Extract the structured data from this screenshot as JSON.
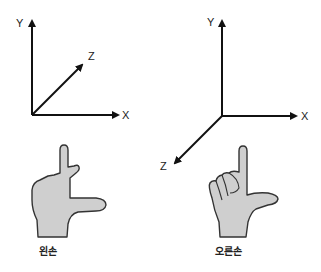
{
  "left_diagram": {
    "title": "왼손",
    "axes": {
      "x": "X",
      "y": "Y",
      "z": "Z"
    },
    "z_direction": "into-page (up-right)"
  },
  "right_diagram": {
    "title": "오른손",
    "axes": {
      "x": "X",
      "y": "Y",
      "z": "Z"
    },
    "z_direction": "out-of-page (down-left)"
  },
  "colors": {
    "line": "#111111",
    "hand_fill": "#cfcfcf",
    "hand_stroke": "#333333"
  }
}
